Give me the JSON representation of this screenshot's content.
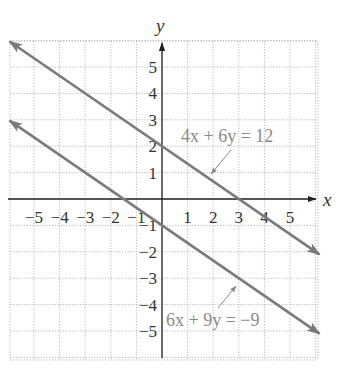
{
  "chart_data": {
    "type": "line",
    "title": "",
    "xlabel": "x",
    "ylabel": "y",
    "xlim": [
      -6,
      6
    ],
    "ylim": [
      -6,
      6
    ],
    "grid": true,
    "x_ticks": [
      "-5",
      "-4",
      "-3",
      "-2",
      "-1",
      "1",
      "2",
      "3",
      "4",
      "5"
    ],
    "y_ticks": [
      "5",
      "4",
      "3",
      "2",
      "1",
      "-1",
      "-2",
      "-3",
      "-4",
      "-5"
    ],
    "series": [
      {
        "name": "4x + 6y = 12",
        "label": "4x + 6y = 12",
        "slope": -0.6667,
        "intercept": 2,
        "x": [
          -6,
          6
        ],
        "y": [
          6,
          -2
        ],
        "points": [
          {
            "x": 0,
            "y": 2
          },
          {
            "x": 3,
            "y": 0
          }
        ]
      },
      {
        "name": "6x + 9y = -9",
        "label": "6x + 9y = −9",
        "slope": -0.6667,
        "intercept": -1,
        "x": [
          -6,
          6
        ],
        "y": [
          3,
          -5
        ],
        "points": [
          {
            "x": 0,
            "y": -1
          },
          {
            "x": -1.5,
            "y": 0
          }
        ]
      }
    ],
    "annotations": [
      {
        "text": "4x + 6y = 12",
        "points_to": {
          "x": 2.5,
          "y": 0.33
        }
      },
      {
        "text": "6x + 9y = −9",
        "points_to": {
          "x": 3,
          "y": -3
        }
      }
    ]
  },
  "labels": {
    "x_axis": "x",
    "y_axis": "y",
    "eq1": "4x + 6y = 12",
    "eq2": "6x + 9y = −9"
  },
  "colors": {
    "line": "#7a7a7a",
    "axis": "#222222",
    "grid": "#b8b8b8",
    "annotation": "#8a8a8a"
  }
}
